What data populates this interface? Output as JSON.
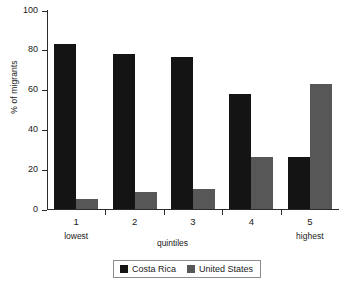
{
  "chart_data": {
    "type": "bar",
    "title": "",
    "xlabel": "quintiles",
    "ylabel": "% of migrants",
    "categories": [
      "1",
      "2",
      "3",
      "4",
      "5"
    ],
    "category_extremes": {
      "first": "lowest",
      "last": "highest"
    },
    "ylim": [
      0,
      100
    ],
    "yticks": [
      0,
      20,
      40,
      60,
      80,
      100
    ],
    "ytick_labels": [
      "0",
      "20",
      "40",
      "60",
      "80",
      "100"
    ],
    "grid": false,
    "legend_position": "bottom-center",
    "series": [
      {
        "name": "Costa Rica",
        "color": "#141414",
        "values": [
          83,
          78,
          76.5,
          58,
          26
        ]
      },
      {
        "name": "United States",
        "color": "#575757",
        "values": [
          5,
          8.5,
          10,
          26,
          63
        ]
      }
    ]
  },
  "axis": {
    "y_title": "% of migrants",
    "x_title": "quintiles"
  },
  "legend": {
    "entries": [
      {
        "label": "Costa Rica"
      },
      {
        "label": "United States"
      }
    ]
  }
}
